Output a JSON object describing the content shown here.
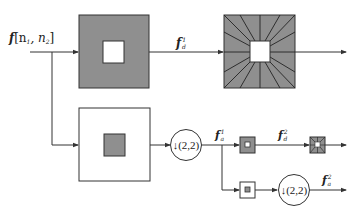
{
  "diagram": {
    "type": "block-diagram",
    "colors": {
      "line": "#333333",
      "gray_fill": "#8f8f8f",
      "white_fill": "#ffffff",
      "background": "#ffffff"
    },
    "input": {
      "label_main": "f",
      "label_args": "[n",
      "label_sub1": "1",
      "label_sep": ", n",
      "label_sub2": "2",
      "label_close": "]"
    },
    "nodes": [
      {
        "id": "highpass-filter-1",
        "kind": "filter",
        "desc": "gray square with white center (highpass)"
      },
      {
        "id": "directional-filter-1",
        "kind": "filter",
        "desc": "gray square with wedge directional partition, white center"
      },
      {
        "id": "lowpass-filter-1",
        "kind": "filter",
        "desc": "white square with gray center (lowpass)"
      },
      {
        "id": "downsample-1",
        "kind": "operator",
        "label": "↓(2,2)"
      },
      {
        "id": "highpass-filter-2",
        "kind": "filter",
        "desc": "small gray square with white center"
      },
      {
        "id": "directional-filter-2",
        "kind": "filter",
        "desc": "small directional wedge filter"
      },
      {
        "id": "lowpass-filter-2",
        "kind": "filter",
        "desc": "small white square with gray center"
      },
      {
        "id": "downsample-2",
        "kind": "operator",
        "label": "↓(2,2)"
      }
    ],
    "signals": {
      "fd1": {
        "main": "f",
        "sub": "d",
        "sup": "1"
      },
      "fa1": {
        "main": "f",
        "sub": "a",
        "sup": "1"
      },
      "fd2": {
        "main": "f",
        "sub": "d",
        "sup": "2"
      },
      "fa2": {
        "main": "f",
        "sub": "a",
        "sup": "2"
      }
    },
    "operators": {
      "down1": "↓(2,2)",
      "down2": "↓(2,2)"
    }
  }
}
